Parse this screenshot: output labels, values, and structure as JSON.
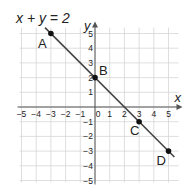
{
  "chart_data": {
    "type": "line",
    "title": "x + y = 2",
    "xlabel": "x",
    "ylabel": "y",
    "xlim": [
      -5,
      5
    ],
    "ylim": [
      -5,
      5
    ],
    "grid": true,
    "x_ticks": [
      -5,
      -4,
      -3,
      -2,
      -1,
      0,
      1,
      2,
      3,
      4,
      5
    ],
    "y_ticks": [
      -5,
      -4,
      -3,
      -2,
      -1,
      1,
      2,
      3,
      4,
      5
    ],
    "series": [
      {
        "name": "x + y = 2",
        "equation": "x + y = 2",
        "line_from": [
          -3.4,
          5.4
        ],
        "line_to": [
          5.4,
          -3.4
        ]
      }
    ],
    "points": [
      {
        "label": "A",
        "x": -3,
        "y": 5
      },
      {
        "label": "B",
        "x": 0,
        "y": 2
      },
      {
        "label": "C",
        "x": 3,
        "y": -1
      },
      {
        "label": "D",
        "x": 5,
        "y": -3
      }
    ]
  },
  "colors": {
    "grid": "#d6d6d6",
    "axis": "#555555",
    "line": "#444444",
    "point": "#111111",
    "text": "#222222"
  }
}
